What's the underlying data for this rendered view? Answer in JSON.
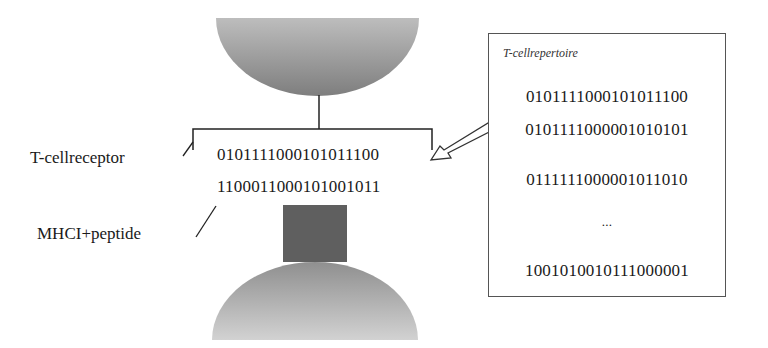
{
  "diagram": {
    "tcell_receptor": {
      "label": "T-cell receptor",
      "sequence": "010111100010101110 0"
    },
    "mhc_peptide": {
      "label": "MHC I + peptide",
      "sequence": "110001100010100101 1"
    },
    "repertoire": {
      "title": "T-cell repertoire",
      "sequences": [
        "010111100010101110 0",
        "010111100000101010 1",
        "011111100000101101 0"
      ],
      "ellipsis": "...",
      "last_sequence": "100101001011100000 1"
    },
    "colors": {
      "tcell_top": "#8a8a8a",
      "tcell_bottom": "#b5b5b5",
      "mhc_block": "#5f5f5f",
      "cell_bottom_top": "#9a9a9a",
      "cell_bottom_bottom": "#cfcfcf",
      "line": "#222222"
    }
  }
}
